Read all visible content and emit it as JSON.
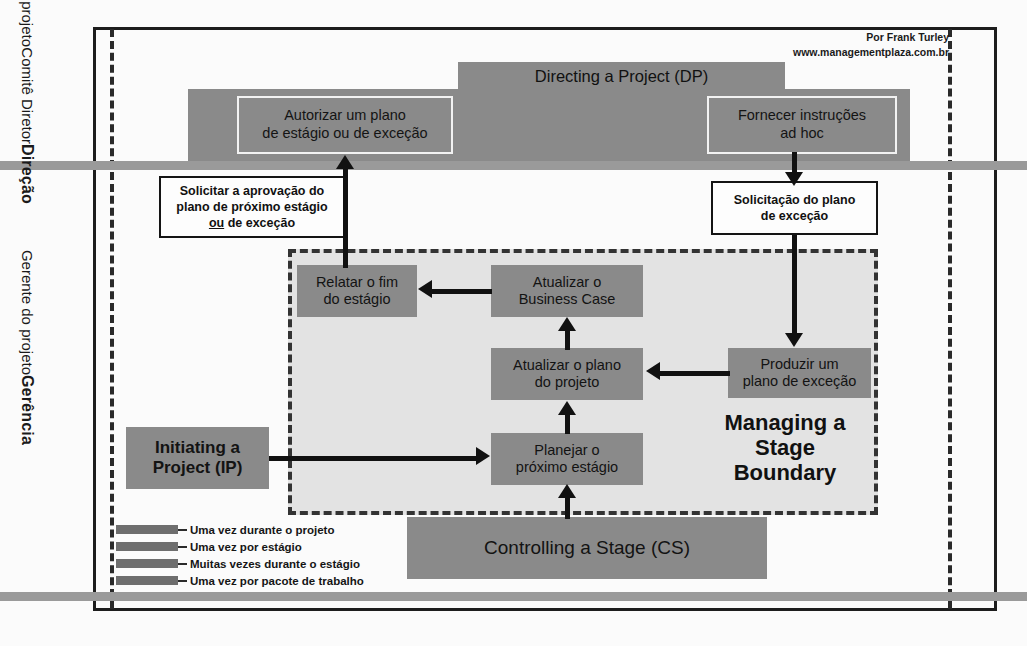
{
  "attribution": {
    "author": "Por Frank Turley",
    "site": "www.managementplaza.com.br"
  },
  "lanes": [
    {
      "name": "direcao",
      "title": "Direção",
      "line2": "Comitê Diretor",
      "line3": "do projeto"
    },
    {
      "name": "gerencia",
      "title": "Gerência",
      "line2": "Gerente do projeto"
    }
  ],
  "directing": {
    "tab_label": "Directing a Project (DP)",
    "activities": [
      {
        "line1": "Autorizar um plano",
        "line2": "de estágio ou de exceção"
      },
      {
        "line1": "Fornecer instruções",
        "line2": "ad hoc"
      }
    ]
  },
  "notes": [
    {
      "id": "approval-request",
      "line1": "Solicitar a aprovação do",
      "line2": "plano de próximo estágio",
      "line3_pre": "",
      "line3_em": "ou",
      "line3_post": " de exceção"
    },
    {
      "id": "exception-plan-request",
      "line1": "Solicitação do plano",
      "line2": "de exceção"
    }
  ],
  "managing_stage_boundary": {
    "title_line1": "Managing a",
    "title_line2": "Stage",
    "title_line3": "Boundary",
    "activities": [
      {
        "id": "relatar-fim-estagio",
        "line1": "Relatar o fim",
        "line2": "do estágio"
      },
      {
        "id": "atualizar-business-case",
        "line1": "Atualizar o",
        "line2": "Business Case"
      },
      {
        "id": "atualizar-plano-projeto",
        "line1": "Atualizar o plano",
        "line2": "do projeto"
      },
      {
        "id": "planejar-proximo-estagio",
        "line1": "Planejar o",
        "line2": "próximo estágio"
      },
      {
        "id": "produzir-plano-excecao",
        "line1": "Produzir um",
        "line2": "plano de exceção"
      }
    ]
  },
  "processes": [
    {
      "id": "initiating-a-project",
      "line1": "Initiating a",
      "line2": "Project (IP)"
    },
    {
      "id": "controlling-a-stage",
      "label": "Controlling a Stage (CS)"
    }
  ],
  "legend": {
    "items": [
      {
        "label": "Uma vez durante o projeto"
      },
      {
        "label": "Uma vez por estágio"
      },
      {
        "label": "Muitas vezes durante o estágio"
      },
      {
        "label": "Uma vez por pacote de trabalho"
      }
    ]
  },
  "colors": {
    "process_box": "#8a8a8a",
    "region_fill": "#e3e3e3",
    "lane_separator": "#9a9a9a",
    "frame": "#1d1d1d",
    "arrow": "#111111"
  }
}
